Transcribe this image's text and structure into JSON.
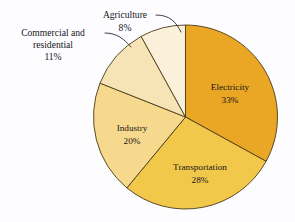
{
  "chart_data": {
    "type": "pie",
    "title": "",
    "subtitle": "",
    "xlabel": "",
    "ylabel": "",
    "legend_position": "none",
    "grid": false,
    "units": "percent",
    "total": 100,
    "start_angle_deg": 0,
    "direction": "clockwise",
    "categories": [
      "Electricity",
      "Transportation",
      "Industry",
      "Commercial and residential",
      "Agriculture"
    ],
    "values": [
      33,
      28,
      20,
      11,
      8
    ],
    "slices": [
      {
        "label": "Electricity",
        "value": 33,
        "percent_text": "33%",
        "color": "#eaa625",
        "label_placement": "inside",
        "label_line1": "Electricity",
        "label_line2": "33%"
      },
      {
        "label": "Transportation",
        "value": 28,
        "percent_text": "28%",
        "color": "#f2c84b",
        "label_placement": "inside",
        "label_line1": "Transportation",
        "label_line2": "28%"
      },
      {
        "label": "Industry",
        "value": 20,
        "percent_text": "20%",
        "color": "#f6d98d",
        "label_placement": "inside",
        "label_line1": "Industry",
        "label_line2": "20%"
      },
      {
        "label": "Commercial and residential",
        "value": 11,
        "percent_text": "11%",
        "color": "#f6e4b6",
        "label_placement": "outside-left",
        "label_line1": "Commercial and",
        "label_line2": "residential",
        "label_line3": "11%"
      },
      {
        "label": "Agriculture",
        "value": 8,
        "percent_text": "8%",
        "color": "#fbf1da",
        "label_placement": "outside-top",
        "label_line1": "Agriculture",
        "label_line2": "8%"
      }
    ],
    "geometry": {
      "center_x": 185.5,
      "center_y": 117,
      "radius": 92
    },
    "colors": {
      "background": "#fdfdff",
      "slice_border": "#4a3a18",
      "leader_line": "#2a2a30",
      "text": "#15151a"
    }
  }
}
